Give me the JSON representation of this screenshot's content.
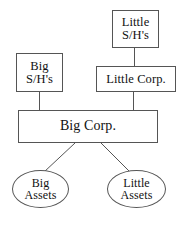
{
  "diagram": {
    "background_color": "#ffffff",
    "stroke_color": "#555555",
    "text_color": "#111111",
    "nodes": [
      {
        "id": "little-sh",
        "label": "Little\nS/H's",
        "shape": "rectangle"
      },
      {
        "id": "big-sh",
        "label": "Big\nS/H's",
        "shape": "rectangle"
      },
      {
        "id": "little-corp",
        "label": "Little Corp.",
        "shape": "rectangle"
      },
      {
        "id": "big-corp",
        "label": "Big Corp.",
        "shape": "rectangle"
      },
      {
        "id": "big-assets",
        "label": "Big\nAssets",
        "shape": "ellipse"
      },
      {
        "id": "little-assets",
        "label": "Little\nAssets",
        "shape": "ellipse"
      }
    ],
    "edges": [
      {
        "from": "little-sh",
        "to": "little-corp",
        "style": "vertical-line"
      },
      {
        "from": "little-corp",
        "to": "big-corp",
        "style": "vertical-line"
      },
      {
        "from": "big-sh",
        "to": "big-corp",
        "style": "vertical-line"
      },
      {
        "from": "big-corp",
        "to": "big-assets",
        "style": "diagonal-line"
      },
      {
        "from": "big-corp",
        "to": "little-assets",
        "style": "diagonal-line"
      }
    ]
  }
}
